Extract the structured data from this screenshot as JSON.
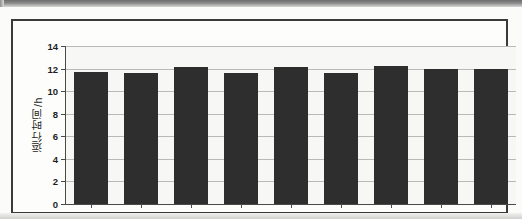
{
  "figure": {
    "y_axis_title": "运行时间/h"
  },
  "chart_data": {
    "type": "bar",
    "title": "",
    "xlabel": "",
    "ylabel": "运行时间/h",
    "categories": [
      "2010",
      "2011",
      "2012",
      "2013",
      "2014",
      "2015",
      "2016",
      "2017",
      "2018"
    ],
    "values": [
      11.7,
      11.6,
      12.1,
      11.65,
      12.15,
      11.6,
      12.25,
      12.0,
      11.95
    ],
    "ylim": [
      0,
      14
    ],
    "ytick_labels": [
      "0",
      "2",
      "4",
      "6",
      "8",
      "10",
      "12",
      "14"
    ],
    "ytick_values": [
      0,
      2,
      4,
      6,
      8,
      10,
      12,
      14
    ],
    "grid": true,
    "legend": "none",
    "bar_color": "#2e2e2e",
    "plot_background": "#f7f7f5",
    "gridline_color": "#b9b9b7",
    "axis_color": "#4a4a4a"
  }
}
